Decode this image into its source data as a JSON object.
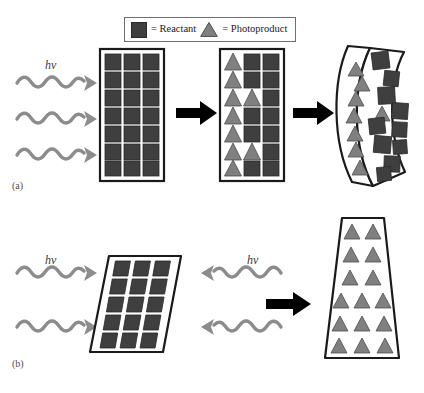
{
  "figure": {
    "background": "#ffffff",
    "width": 424,
    "height": 393
  },
  "legend": {
    "reactant_label": "= Reactant",
    "photoproduct_label": "= Photoproduct",
    "reactant_icon": "filled-square",
    "photoproduct_icon": "filled-triangle",
    "border_color": "#6e6e6e"
  },
  "colors": {
    "reactant": "#3f3f3f",
    "reactant_stroke": "#2a2a2a",
    "photoproduct": "#808080",
    "photoproduct_stroke": "#4d4d4d",
    "crystal_outline": "#1a1a1a",
    "light_wave": "#8c8c8c",
    "process_arrow": "#000000",
    "text": "#1a1a1a"
  },
  "panels": [
    {
      "id": "a",
      "label": "(a)",
      "light": {
        "symbol": "hv",
        "count": 3,
        "direction": "left-to-right"
      },
      "stages": [
        {
          "name": "pristine-crystal",
          "shape": "rectangle",
          "columns": 3,
          "rows": 7,
          "contents": [
            [
              "square",
              "square",
              "square"
            ],
            [
              "square",
              "square",
              "square"
            ],
            [
              "square",
              "square",
              "square"
            ],
            [
              "square",
              "square",
              "square"
            ],
            [
              "square",
              "square",
              "square"
            ],
            [
              "square",
              "square",
              "square"
            ],
            [
              "square",
              "square",
              "square"
            ]
          ]
        },
        {
          "name": "partially-reacted-crystal",
          "shape": "rectangle",
          "columns": 3,
          "rows": 7,
          "contents": [
            [
              "triangle",
              "square",
              "square"
            ],
            [
              "triangle",
              "square",
              "square"
            ],
            [
              "triangle",
              "triangle",
              "square"
            ],
            [
              "triangle",
              "square",
              "square"
            ],
            [
              "triangle",
              "square",
              "square"
            ],
            [
              "triangle",
              "triangle",
              "square"
            ],
            [
              "triangle",
              "square",
              "square"
            ]
          ]
        },
        {
          "name": "bent-crystal",
          "shape": "curved-bent",
          "bend_direction": "right",
          "triangles": 8,
          "squares": 11
        }
      ],
      "arrows": 2
    },
    {
      "id": "b",
      "label": "(b)",
      "light": {
        "symbol": "hv",
        "count": 4,
        "direction": "both-sides"
      },
      "stages": [
        {
          "name": "slanted-crystal",
          "shape": "parallelogram",
          "rows": 5,
          "columns": 3,
          "contents": [
            [
              "square",
              "square",
              "square"
            ],
            [
              "square",
              "square",
              "square"
            ],
            [
              "square",
              "square",
              "square"
            ],
            [
              "square",
              "square",
              "square"
            ],
            [
              "square",
              "square",
              "square"
            ]
          ]
        },
        {
          "name": "reacted-trapezoid-crystal",
          "shape": "trapezoid",
          "rows": 6,
          "contents": [
            [
              "triangle",
              "triangle"
            ],
            [
              "triangle",
              "triangle"
            ],
            [
              "triangle",
              "triangle"
            ],
            [
              "triangle",
              "triangle",
              "triangle"
            ],
            [
              "triangle",
              "triangle",
              "triangle"
            ],
            [
              "triangle",
              "triangle",
              "triangle"
            ]
          ]
        }
      ],
      "arrows": 1
    }
  ]
}
